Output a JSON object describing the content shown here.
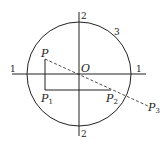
{
  "labels": {
    "axis_left": "1",
    "axis_right": "1",
    "axis_top": "2",
    "axis_bottom": "2",
    "circle": "3",
    "origin": "O",
    "p": "P",
    "p1": "P",
    "p1_sub": "1",
    "p2": "P",
    "p2_sub": "2",
    "p3": "P",
    "p3_sub": "3"
  },
  "colors": {
    "stroke": "#222222"
  }
}
